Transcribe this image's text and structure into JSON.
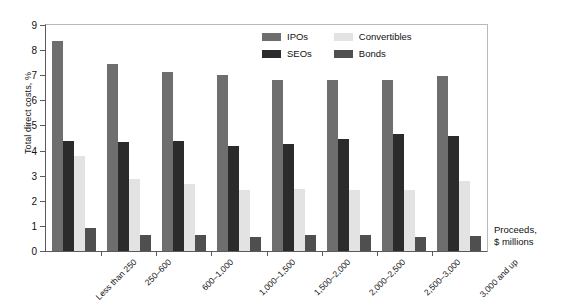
{
  "chart_data": {
    "type": "bar",
    "title": "",
    "subtitle": "",
    "xlabel": "Proceeds, $ millions",
    "ylabel": "Total direct costs, %",
    "ylim": [
      0,
      9
    ],
    "yticks": [
      0,
      1,
      2,
      3,
      4,
      5,
      6,
      7,
      8,
      9
    ],
    "grid": false,
    "legend_position": "top-right",
    "categories": [
      "Less than 250",
      "250–600",
      "600–1,000",
      "1,000–1,500",
      "1,500–2,000",
      "2,000–2,500",
      "2,500–3,000",
      "3,000 and up"
    ],
    "series": [
      {
        "name": "IPOs",
        "color": "#6e6e6e",
        "values": [
          8.35,
          7.43,
          7.13,
          6.99,
          6.82,
          6.8,
          6.82,
          6.97
        ]
      },
      {
        "name": "SEOs",
        "color": "#2b2b2b",
        "values": [
          4.38,
          4.33,
          4.39,
          4.18,
          4.27,
          4.47,
          4.65,
          4.57
        ]
      },
      {
        "name": "Convertibles",
        "color": "#e3e3e3",
        "values": [
          3.8,
          2.85,
          2.65,
          2.42,
          2.48,
          2.44,
          2.42,
          2.8
        ]
      },
      {
        "name": "Bonds",
        "color": "#4f4f4f",
        "values": [
          0.9,
          0.62,
          0.62,
          0.55,
          0.62,
          0.65,
          0.55,
          0.6
        ]
      }
    ]
  },
  "axis": {
    "y_title": "Total direct costs, %",
    "x_title_line1": "Proceeds,",
    "x_title_line2": "$ millions"
  },
  "legend": {
    "entries": [
      {
        "label": "IPOs",
        "color": "#6e6e6e"
      },
      {
        "label": "Convertibles",
        "color": "#e3e3e3"
      },
      {
        "label": "SEOs",
        "color": "#2b2b2b"
      },
      {
        "label": "Bonds",
        "color": "#4f4f4f"
      }
    ]
  }
}
